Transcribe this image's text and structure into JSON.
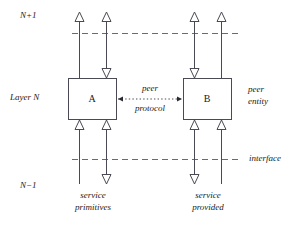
{
  "diagram": {
    "colors": {
      "line": "#4a4a55",
      "dash": "#6a6a75",
      "text": "#1a1a1a",
      "background": "#ffffff"
    },
    "layer_labels": {
      "above": "N+1",
      "current": "Layer N",
      "below": "N−1"
    },
    "entities": [
      {
        "id": "A",
        "label": "A"
      },
      {
        "id": "B",
        "label": "B"
      }
    ],
    "connection": {
      "label_line1": "peer",
      "label_line2": "protocol",
      "style": "dotted",
      "arrowheads": "both"
    },
    "annotations": {
      "peer_entity_line1": "peer",
      "peer_entity_line2": "entity",
      "interface": "interface",
      "service_primitives_line1": "service",
      "service_primitives_line2": "primitives",
      "service_provided_line1": "service",
      "service_provided_line2": "provided"
    }
  }
}
